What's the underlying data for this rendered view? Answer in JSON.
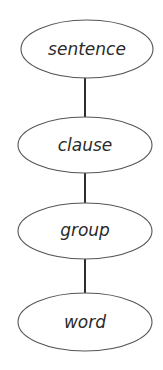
{
  "diagram": {
    "type": "hierarchy",
    "orientation": "vertical",
    "nodes": [
      {
        "id": "sentence",
        "label": "sentence",
        "cx": 87,
        "cy": 49,
        "rx": 66,
        "ry": 29
      },
      {
        "id": "clause",
        "label": "clause",
        "cx": 85,
        "cy": 145,
        "rx": 67,
        "ry": 28
      },
      {
        "id": "group",
        "label": "group",
        "cx": 85,
        "cy": 231,
        "rx": 67,
        "ry": 28
      },
      {
        "id": "word",
        "label": "word",
        "cx": 85,
        "cy": 322,
        "rx": 67,
        "ry": 29
      }
    ],
    "edges": [
      {
        "from": "sentence",
        "to": "clause"
      },
      {
        "from": "clause",
        "to": "group"
      },
      {
        "from": "group",
        "to": "word"
      }
    ],
    "colors": {
      "background": "#ffffff",
      "node_stroke": "#555555",
      "edge": "#2e2e2e",
      "text": "#2a2a2a"
    }
  }
}
